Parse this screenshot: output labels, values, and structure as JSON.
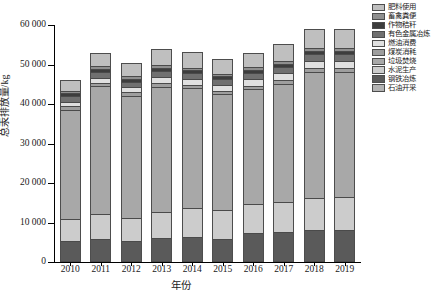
{
  "chart_data": {
    "type": "bar",
    "stacked": true,
    "title": "",
    "subtitle": "",
    "xlabel": "年份",
    "ylabel": "总汞排放量/kg",
    "ylim": [
      0,
      60000
    ],
    "ytick_labels": [
      "0",
      "10 000",
      "20 000",
      "30 000",
      "40 000",
      "50 000",
      "60 000"
    ],
    "ytick_values": [
      0,
      10000,
      20000,
      30000,
      40000,
      50000,
      60000
    ],
    "grid": false,
    "legend_position": "right-top",
    "categories": [
      "2010",
      "2011",
      "2012",
      "2013",
      "2014",
      "2015",
      "2016",
      "2017",
      "2018",
      "2019"
    ],
    "series": [
      {
        "name": "石油开采",
        "color": "#b3b3b3",
        "values": [
          150,
          160,
          165,
          175,
          180,
          185,
          195,
          200,
          210,
          215
        ]
      },
      {
        "name": "钢铁冶炼",
        "color": "#5a5a5a",
        "values": [
          5100,
          5550,
          5200,
          5850,
          6150,
          5650,
          7050,
          7300,
          7850,
          7900
        ]
      },
      {
        "name": "水泥生产",
        "color": "#cccccc",
        "values": [
          5650,
          6350,
          5700,
          6700,
          7400,
          7350,
          7450,
          7700,
          8150,
          8250
        ]
      },
      {
        "name": "垃圾焚烧",
        "color": "#a8a8a8",
        "values": [
          27700,
          32400,
          31000,
          31650,
          30250,
          29300,
          29000,
          29900,
          31950,
          31850
        ]
      },
      {
        "name": "煤炭消耗",
        "color": "#9e9e9e",
        "values": [
          850,
          900,
          870,
          920,
          950,
          930,
          960,
          980,
          1000,
          1010
        ]
      },
      {
        "name": "燃油消费",
        "color": "#e0e0e0",
        "values": [
          1100,
          1350,
          1300,
          1500,
          1400,
          1450,
          1600,
          1750,
          1800,
          1750
        ]
      },
      {
        "name": "有色金属冶炼",
        "color": "#707070",
        "values": [
          1450,
          1500,
          1450,
          1550,
          1500,
          1450,
          1550,
          1600,
          1650,
          1650
        ]
      },
      {
        "name": "作物秸秆",
        "color": "#3d3d3d",
        "values": [
          700,
          750,
          720,
          780,
          760,
          740,
          800,
          820,
          850,
          860
        ]
      },
      {
        "name": "畜禽粪便",
        "color": "#8f8f8f",
        "values": [
          600,
          640,
          620,
          660,
          650,
          640,
          680,
          700,
          720,
          730
        ]
      },
      {
        "name": "肥料使用",
        "color": "#bfbfbf",
        "values": [
          2700,
          3400,
          3275,
          4205,
          3810,
          3805,
          3715,
          4250,
          4820,
          4785
        ]
      }
    ],
    "totals": [
      46000,
      53000,
      50300,
      54000,
      53050,
      51500,
      53000,
      55200,
      57000,
      57000
    ]
  },
  "legend": {
    "items": [
      {
        "label": "肥料使用",
        "color": "#bfbfbf"
      },
      {
        "label": "畜禽粪便",
        "color": "#8f8f8f"
      },
      {
        "label": "作物秸秆",
        "color": "#3d3d3d"
      },
      {
        "label": "有色金属冶炼",
        "color": "#707070"
      },
      {
        "label": "燃油消费",
        "color": "#e0e0e0"
      },
      {
        "label": "煤炭消耗",
        "color": "#9e9e9e"
      },
      {
        "label": "垃圾焚烧",
        "color": "#a8a8a8"
      },
      {
        "label": "水泥生产",
        "color": "#cccccc"
      },
      {
        "label": "钢铁冶炼",
        "color": "#5a5a5a"
      },
      {
        "label": "石油开采",
        "color": "#b3b3b3"
      }
    ]
  }
}
